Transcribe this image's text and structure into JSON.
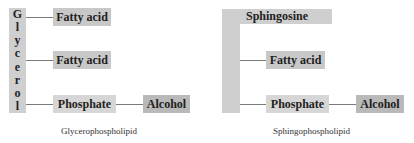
{
  "glycerophospholipid": {
    "backbone_letters": [
      "G",
      "l",
      "y",
      "c",
      "e",
      "r",
      "o",
      "l"
    ],
    "backbone": "Glycerol",
    "fatty_acid_1": "Fatty acid",
    "fatty_acid_2": "Fatty acid",
    "phosphate": "Phosphate",
    "alcohol": "Alcohol",
    "caption": "Glycerophospholipid"
  },
  "sphingophospholipid": {
    "backbone": "Sphingosine",
    "fatty_acid": "Fatty acid",
    "phosphate": "Phosphate",
    "alcohol": "Alcohol",
    "caption": "Sphingophospholipid"
  },
  "colors": {
    "box": "#c8c8c8",
    "alcohol_box": "#b9b9b9",
    "connector": "#7a7a7a"
  }
}
